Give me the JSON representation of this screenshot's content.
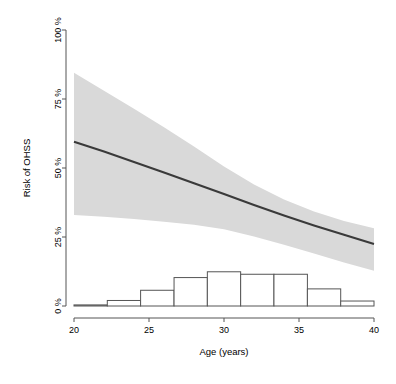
{
  "chart_data": {
    "type": "line",
    "title": "",
    "subtitle": "",
    "xlabel": "Age (years)",
    "ylabel": "Risk of OHSS",
    "xlim": [
      20,
      40
    ],
    "ylim": [
      0,
      100
    ],
    "grid": false,
    "legend": null,
    "x_ticks": [
      20,
      25,
      30,
      35,
      40
    ],
    "x_tick_labels": [
      "20",
      "25",
      "30",
      "35",
      "40"
    ],
    "y_ticks": [
      0,
      25,
      50,
      75,
      100
    ],
    "y_tick_labels": [
      "0 %",
      "25 %",
      "50 %",
      "75 %",
      "100 %"
    ],
    "series": [
      {
        "name": "Predicted risk of OHSS",
        "type": "line",
        "color": "#3a3a3a",
        "x": [
          20,
          22,
          24,
          26,
          28,
          30,
          32,
          34,
          36,
          38,
          40
        ],
        "values": [
          59.5,
          56.0,
          52.2,
          48.4,
          44.5,
          40.6,
          36.6,
          32.8,
          29.2,
          25.8,
          22.5
        ]
      },
      {
        "name": "95% confidence band (upper)",
        "type": "band-upper",
        "color": "#d9d9d9",
        "x": [
          20,
          22,
          24,
          26,
          28,
          30,
          32,
          34,
          36,
          38,
          40
        ],
        "values": [
          84.5,
          78.0,
          71.5,
          64.8,
          57.8,
          50.5,
          44.0,
          38.6,
          34.2,
          30.8,
          28.2
        ]
      },
      {
        "name": "95% confidence band (lower)",
        "type": "band-lower",
        "color": "#d9d9d9",
        "x": [
          20,
          22,
          24,
          26,
          28,
          30,
          32,
          34,
          36,
          38,
          40
        ],
        "values": [
          33.0,
          32.3,
          31.5,
          30.5,
          29.4,
          27.8,
          25.2,
          22.2,
          19.0,
          15.8,
          12.8
        ]
      },
      {
        "name": "Age distribution histogram",
        "type": "histogram",
        "color": "#ffffff",
        "edge_color": "#555555",
        "bin_edges": [
          20.0,
          22.22,
          24.44,
          26.67,
          28.89,
          31.11,
          33.33,
          35.56,
          37.78,
          40.0
        ],
        "values": [
          0.4,
          2.0,
          5.7,
          10.3,
          12.4,
          11.5,
          11.5,
          6.2,
          1.8
        ]
      }
    ],
    "annotations": []
  },
  "axes": {
    "y_axis_title": "Risk of OHSS",
    "x_axis_title": "Age (years)"
  }
}
